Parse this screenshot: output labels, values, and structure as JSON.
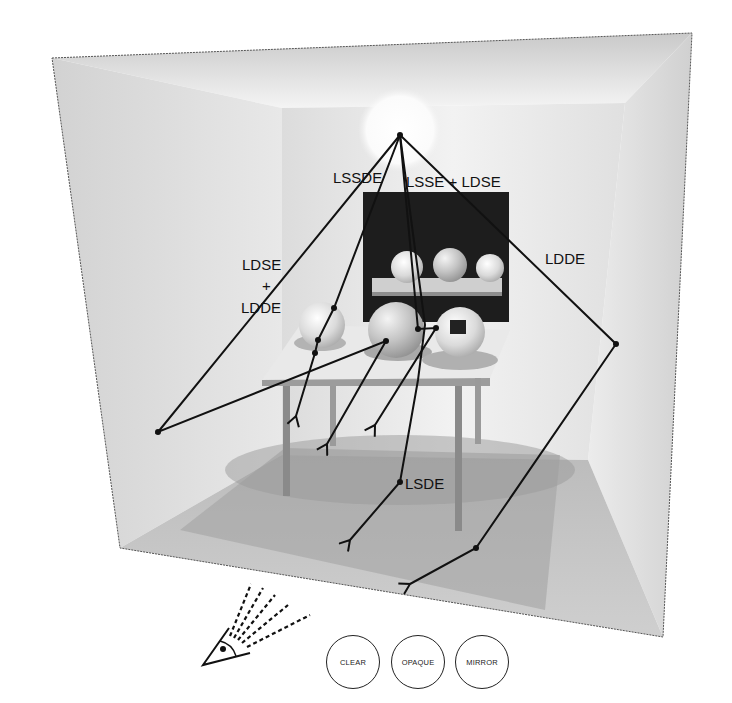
{
  "diagram": {
    "paths": [
      {
        "label": "LSSDE"
      },
      {
        "label": "LSSE + LDSE"
      },
      {
        "label_lines": [
          "LDSE",
          "+",
          "LDDE"
        ]
      },
      {
        "label": "LDDE"
      },
      {
        "label": "LSDE"
      }
    ],
    "eye_icon": "eye-with-view-rays-icon"
  },
  "controls": {
    "buttons": [
      {
        "label": "CLEAR"
      },
      {
        "label": "OPAQUE"
      },
      {
        "label": "MIRROR"
      }
    ]
  }
}
